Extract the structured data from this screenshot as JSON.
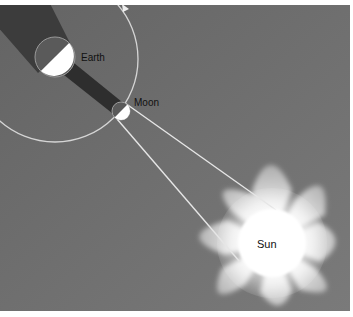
{
  "diagram": {
    "type": "solar-eclipse-geometry",
    "labels": {
      "earth": "Earth",
      "moon": "Moon",
      "sun": "Sun"
    },
    "colors": {
      "background": "#6e6e6e",
      "page": "#ffffff",
      "shadow": "#3a3a3a",
      "orbit": "#d8d8d8",
      "sun": "#ffffff",
      "corona": "#bdbdbd",
      "text": "#111111"
    },
    "elements": {
      "earth": {
        "cx": 55,
        "cy": 57,
        "r": 20
      },
      "moon": {
        "cx": 121,
        "cy": 111,
        "r": 9
      },
      "sun": {
        "cx": 272,
        "cy": 243,
        "r": 34
      },
      "orbit": {
        "cx": 55,
        "cy": 59,
        "r": 83,
        "direction": "counter-clockwise arrow at top"
      }
    }
  }
}
